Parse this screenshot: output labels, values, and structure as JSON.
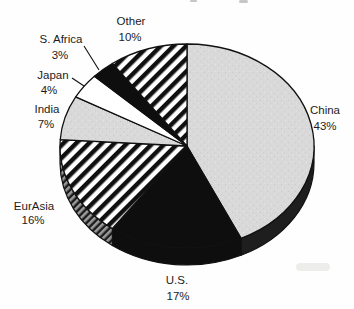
{
  "figure": {
    "background_color": "#fefefe",
    "title": ""
  },
  "colors": {
    "black": "#0e0e0e",
    "white": "#ffffff",
    "light_gray": "#d9d9d9",
    "dark_side": "#1e1e1e",
    "hatch_stripe": "#101010",
    "side_hatch_gray": "#9a9a9a",
    "outline": "#111111",
    "text": "#1c1c1c",
    "artifact_gray": "#a8a8a8",
    "shadow_smudge": "#e3e3e0"
  },
  "chart_data": {
    "type": "pie",
    "style": "3d-ellipse",
    "title": "",
    "start_angle": "12 o'clock",
    "direction": "clockwise",
    "legend_position": "none (labels around pie)",
    "categories": [
      "China",
      "U.S.",
      "EurAsia",
      "India",
      "Japan",
      "S. Africa",
      "Other"
    ],
    "values": [
      43,
      17,
      16,
      7,
      4,
      3,
      10
    ],
    "geometry": {
      "cx": 187,
      "cy": 146,
      "rx": 127,
      "ry": 102,
      "depth": 17
    },
    "slices": [
      {
        "name": "china",
        "label_line1": "China",
        "label_line2": "43%",
        "value": 43,
        "fill": "speckle",
        "side": "dark",
        "label": {
          "x1": 325,
          "y1": 114,
          "x2": 325,
          "y2": 130
        }
      },
      {
        "name": "us",
        "label_line1": "U.S.",
        "label_line2": "17%",
        "value": 17,
        "fill": "black",
        "side": "black",
        "label": {
          "x1": 177,
          "y1": 284,
          "x2": 178,
          "y2": 300
        }
      },
      {
        "name": "eurasia",
        "label_line1": "EurAsia",
        "label_line2": "16%",
        "value": 16,
        "fill": "hatch",
        "side": "sidehatch",
        "label": {
          "x1": 34,
          "y1": 210,
          "x2": 33,
          "y2": 224
        }
      },
      {
        "name": "india",
        "label_line1": "India",
        "label_line2": "7%",
        "value": 7,
        "fill": "speckle",
        "side": null,
        "label": {
          "x1": 47,
          "y1": 113,
          "x2": 46,
          "y2": 128
        }
      },
      {
        "name": "japan",
        "label_line1": "Japan",
        "label_line2": "4%",
        "value": 4,
        "fill": "white",
        "side": null,
        "label": {
          "x1": 53,
          "y1": 79,
          "x2": 49,
          "y2": 94
        }
      },
      {
        "name": "s-africa",
        "label_line1": "S. Africa",
        "label_line2": "3%",
        "value": 3,
        "fill": "black",
        "side": null,
        "label": {
          "x1": 61,
          "y1": 43,
          "x2": 60,
          "y2": 59
        }
      },
      {
        "name": "other",
        "label_line1": "Other",
        "label_line2": "10%",
        "value": 10,
        "fill": "hatch",
        "side": null,
        "label": {
          "x1": 131,
          "y1": 25,
          "x2": 130,
          "y2": 41
        }
      }
    ],
    "leader_lines": [
      {
        "for": "s-africa",
        "x1": 84,
        "y1": 46,
        "x2": 99,
        "y2": 70
      },
      {
        "for": "japan",
        "x1": 72,
        "y1": 78,
        "x2": 84,
        "y2": 86
      }
    ],
    "artifacts": [
      {
        "name": "cropped-text-remnant-left",
        "x": 190,
        "y": 0,
        "w": 7,
        "h": 2,
        "color_key": "artifact_gray"
      },
      {
        "name": "cropped-text-remnant-right",
        "x": 239,
        "y": 0,
        "w": 9,
        "h": 3,
        "color_key": "artifact_gray"
      },
      {
        "name": "scan-shadow-smudge",
        "x": 296,
        "y": 263,
        "w": 34,
        "h": 8,
        "color_key": "shadow_smudge"
      }
    ]
  }
}
